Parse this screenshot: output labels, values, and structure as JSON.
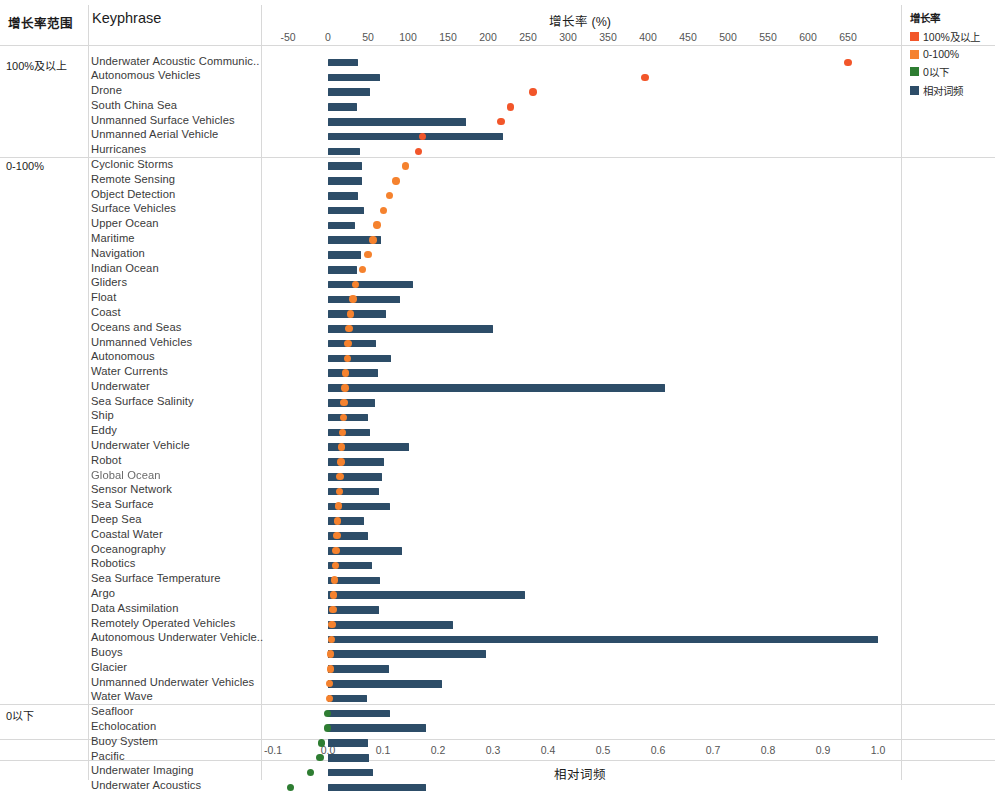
{
  "header": {
    "range_col": "增长率范围",
    "keyphrase_col": "Keyphrase"
  },
  "legend": {
    "title": "增长率",
    "items": [
      {
        "label": "100%及以上",
        "color": "#f2562a"
      },
      {
        "label": "0-100%",
        "color": "#f5822e"
      },
      {
        "label": "0以下",
        "color": "#2e7d32"
      },
      {
        "label": "相对词频",
        "color": "#2d4d68"
      }
    ]
  },
  "chart_data": {
    "type": "bar",
    "title": "",
    "top_axis": {
      "label": "增长率（%）",
      "title_text": "增长率 (%)",
      "ticks": [
        -50,
        0,
        50,
        100,
        150,
        200,
        250,
        300,
        350,
        400,
        450,
        500,
        550,
        600,
        650
      ],
      "tick_labels": [
        "-50",
        "0",
        "50",
        "100",
        "150",
        "200",
        "250",
        "300",
        "350",
        "400",
        "450",
        "500",
        "550",
        "600",
        "650"
      ],
      "range": [
        -50,
        650
      ]
    },
    "bottom_axis": {
      "label": "相对词频",
      "ticks": [
        -0.1,
        0.0,
        0.1,
        0.2,
        0.3,
        0.4,
        0.5,
        0.6,
        0.7,
        0.8,
        0.9,
        1.0
      ],
      "tick_labels": [
        "-0.1",
        "0.0",
        "0.1",
        "0.2",
        "0.3",
        "0.4",
        "0.5",
        "0.6",
        "0.7",
        "0.8",
        "0.9",
        "1.0"
      ],
      "range": [
        -0.1,
        1.0
      ]
    },
    "series": [
      {
        "name": "相对词频",
        "type": "bar",
        "axis": "bottom",
        "color": "#2d4d68"
      },
      {
        "name": "增长率",
        "type": "scatter",
        "axis": "top"
      }
    ],
    "groups": [
      {
        "group": "100%及以上",
        "dot_color": "#f2562a",
        "rows": [
          {
            "keyphrase": "Underwater Acoustic Communic..",
            "freq": 0.055,
            "growth": 650
          },
          {
            "keyphrase": "Autonomous Vehicles",
            "freq": 0.095,
            "growth": 396
          },
          {
            "keyphrase": "Drone",
            "freq": 0.077,
            "growth": 256
          },
          {
            "keyphrase": "South China Sea",
            "freq": 0.052,
            "growth": 228
          },
          {
            "keyphrase": "Unmanned Surface Vehicles",
            "freq": 0.25,
            "growth": 216
          },
          {
            "keyphrase": "Unmanned Aerial Vehicle",
            "freq": 0.318,
            "growth": 118
          },
          {
            "keyphrase": "Hurricanes",
            "freq": 0.058,
            "growth": 113
          }
        ]
      },
      {
        "group": "0-100%",
        "dot_color": "#f5822e",
        "rows": [
          {
            "keyphrase": "Cyclonic Storms",
            "freq": 0.062,
            "growth": 97
          },
          {
            "keyphrase": "Remote Sensing",
            "freq": 0.061,
            "growth": 85
          },
          {
            "keyphrase": "Object Detection",
            "freq": 0.055,
            "growth": 77
          },
          {
            "keyphrase": "Surface Vehicles",
            "freq": 0.066,
            "growth": 69
          },
          {
            "keyphrase": "Upper Ocean",
            "freq": 0.049,
            "growth": 61
          },
          {
            "keyphrase": "Maritime",
            "freq": 0.096,
            "growth": 56
          },
          {
            "keyphrase": "Navigation",
            "freq": 0.06,
            "growth": 50
          },
          {
            "keyphrase": "Indian Ocean",
            "freq": 0.053,
            "growth": 43
          },
          {
            "keyphrase": "Gliders",
            "freq": 0.155,
            "growth": 34
          },
          {
            "keyphrase": "Float",
            "freq": 0.13,
            "growth": 31
          },
          {
            "keyphrase": "Coast",
            "freq": 0.105,
            "growth": 28
          },
          {
            "keyphrase": "Oceans and Seas",
            "freq": 0.3,
            "growth": 26
          },
          {
            "keyphrase": "Unmanned Vehicles",
            "freq": 0.088,
            "growth": 25
          },
          {
            "keyphrase": "Autonomous",
            "freq": 0.115,
            "growth": 24
          },
          {
            "keyphrase": "Water Currents",
            "freq": 0.09,
            "growth": 22
          },
          {
            "keyphrase": "Underwater",
            "freq": 0.613,
            "growth": 21
          },
          {
            "keyphrase": "Sea Surface Salinity",
            "freq": 0.085,
            "growth": 20
          },
          {
            "keyphrase": "Ship",
            "freq": 0.072,
            "growth": 19
          },
          {
            "keyphrase": "Eddy",
            "freq": 0.077,
            "growth": 18
          },
          {
            "keyphrase": "Underwater Vehicle",
            "freq": 0.148,
            "growth": 17
          },
          {
            "keyphrase": "Robot",
            "freq": 0.102,
            "growth": 16
          },
          {
            "keyphrase": "Global Ocean",
            "freq": 0.098,
            "growth": 15
          },
          {
            "keyphrase": "Sensor Network",
            "freq": 0.093,
            "growth": 14
          },
          {
            "keyphrase": "Sea Surface",
            "freq": 0.113,
            "growth": 13
          },
          {
            "keyphrase": "Deep Sea",
            "freq": 0.065,
            "growth": 12
          },
          {
            "keyphrase": "Coastal Water",
            "freq": 0.073,
            "growth": 11
          },
          {
            "keyphrase": "Oceanography",
            "freq": 0.135,
            "growth": 10
          },
          {
            "keyphrase": "Robotics",
            "freq": 0.08,
            "growth": 9
          },
          {
            "keyphrase": "Sea Surface Temperature",
            "freq": 0.095,
            "growth": 8
          },
          {
            "keyphrase": "Argo",
            "freq": 0.358,
            "growth": 7
          },
          {
            "keyphrase": "Data Assimilation",
            "freq": 0.092,
            "growth": 6
          },
          {
            "keyphrase": "Remotely Operated Vehicles",
            "freq": 0.228,
            "growth": 5
          },
          {
            "keyphrase": "Autonomous Underwater Vehicle..",
            "freq": 1.0,
            "growth": 4
          },
          {
            "keyphrase": "Buoys",
            "freq": 0.287,
            "growth": 3
          },
          {
            "keyphrase": "Glacier",
            "freq": 0.11,
            "growth": 3
          },
          {
            "keyphrase": "Unmanned Underwater Vehicles",
            "freq": 0.208,
            "growth": 2
          },
          {
            "keyphrase": "Water Wave",
            "freq": 0.07,
            "growth": 2
          }
        ]
      },
      {
        "group": "0以下",
        "dot_color": "#2e7d32",
        "rows": [
          {
            "keyphrase": "Seafloor",
            "freq": 0.113,
            "growth": -1
          },
          {
            "keyphrase": "Echolocation",
            "freq": 0.178,
            "growth": -1
          },
          {
            "keyphrase": "Buoy System",
            "freq": 0.072,
            "growth": -8
          },
          {
            "keyphrase": "Pacific",
            "freq": 0.075,
            "growth": -10
          },
          {
            "keyphrase": "Underwater Imaging",
            "freq": 0.082,
            "growth": -22
          },
          {
            "keyphrase": "Underwater Acoustics",
            "freq": 0.178,
            "growth": -47
          }
        ]
      }
    ]
  }
}
